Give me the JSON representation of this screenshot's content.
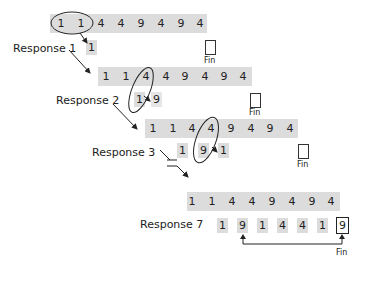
{
  "diagram": {
    "sequence": [
      "1",
      "1",
      "4",
      "4",
      "9",
      "4",
      "9",
      "4"
    ],
    "rows": [
      {
        "id": "row1",
        "digits": [
          "1",
          "1",
          "4",
          "4",
          "9",
          "4",
          "9",
          "4"
        ]
      },
      {
        "id": "row2",
        "digits": [
          "1",
          "1",
          "4",
          "4",
          "9",
          "4",
          "9",
          "4"
        ]
      },
      {
        "id": "row3",
        "digits": [
          "1",
          "1",
          "4",
          "4",
          "9",
          "4",
          "9",
          "4"
        ]
      },
      {
        "id": "row4",
        "digits": [
          "1",
          "1",
          "4",
          "4",
          "9",
          "4",
          "9",
          "4"
        ]
      }
    ],
    "responses": [
      {
        "label": "Response 1",
        "output": [
          "1"
        ]
      },
      {
        "label": "Response 2",
        "output": [
          "1",
          "9"
        ]
      },
      {
        "label": "Response 3",
        "output": [
          "1",
          "9",
          "1"
        ]
      },
      {
        "label": "Response 7",
        "output": [
          "1",
          "9",
          "1",
          "4",
          "4",
          "1",
          "9"
        ]
      }
    ],
    "fin_label": "Fin",
    "colors": {
      "bar": "#dcdcdc",
      "ink": "#222222"
    }
  }
}
